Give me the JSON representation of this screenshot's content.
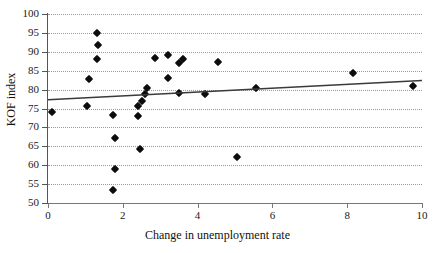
{
  "chart_data": {
    "type": "scatter",
    "title": "",
    "xlabel": "Change in unemployment rate",
    "ylabel": "KOF index",
    "xlim": [
      0,
      10
    ],
    "ylim": [
      50,
      100
    ],
    "xticks": [
      0,
      2,
      4,
      6,
      8,
      10
    ],
    "yticks": [
      50,
      55,
      60,
      65,
      70,
      75,
      80,
      85,
      90,
      95,
      100
    ],
    "xtick_labels": [
      "0",
      "2",
      "4",
      "6",
      "8",
      "10"
    ],
    "ytick_labels": [
      "50",
      "55",
      "60",
      "65",
      "70",
      "75",
      "80",
      "85",
      "90",
      "95",
      "100"
    ],
    "grid": "horizontal-dotted",
    "legend": "none",
    "marker_style": "filled-diamond",
    "marker_color": "#0c0c0c",
    "trendline": {
      "type": "linear",
      "color": "#3a3a3a",
      "x_start": 0,
      "y_start": 77.3,
      "x_end": 10,
      "y_end": 82.4
    },
    "points": [
      {
        "x": 0.1,
        "y": 74.0
      },
      {
        "x": 1.05,
        "y": 75.6
      },
      {
        "x": 1.1,
        "y": 82.8
      },
      {
        "x": 1.3,
        "y": 94.9
      },
      {
        "x": 1.35,
        "y": 91.9
      },
      {
        "x": 1.3,
        "y": 88.0
      },
      {
        "x": 1.75,
        "y": 73.2
      },
      {
        "x": 1.8,
        "y": 67.3
      },
      {
        "x": 1.8,
        "y": 59.0
      },
      {
        "x": 1.75,
        "y": 53.4
      },
      {
        "x": 2.4,
        "y": 73.1
      },
      {
        "x": 2.4,
        "y": 75.7
      },
      {
        "x": 2.45,
        "y": 64.2
      },
      {
        "x": 2.5,
        "y": 76.9
      },
      {
        "x": 2.6,
        "y": 78.8
      },
      {
        "x": 2.65,
        "y": 80.4
      },
      {
        "x": 2.85,
        "y": 88.4
      },
      {
        "x": 3.2,
        "y": 89.1
      },
      {
        "x": 3.2,
        "y": 83.2
      },
      {
        "x": 3.5,
        "y": 87.1
      },
      {
        "x": 3.6,
        "y": 88.1
      },
      {
        "x": 3.5,
        "y": 79.2
      },
      {
        "x": 4.2,
        "y": 78.9
      },
      {
        "x": 4.55,
        "y": 87.4
      },
      {
        "x": 5.05,
        "y": 62.3
      },
      {
        "x": 5.55,
        "y": 80.3
      },
      {
        "x": 8.15,
        "y": 84.4
      },
      {
        "x": 9.75,
        "y": 81.0
      }
    ]
  }
}
